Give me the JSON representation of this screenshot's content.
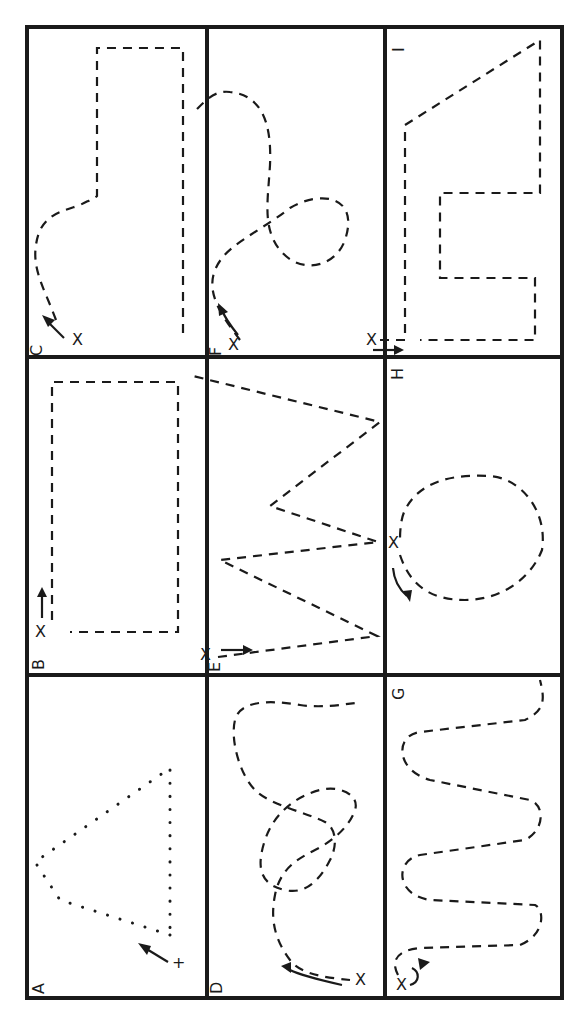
{
  "diagram": {
    "cells": [
      {
        "id": "A",
        "label": "A",
        "shape": "dotted triangle",
        "start_marker": "+",
        "direction": "arrow toward triangle"
      },
      {
        "id": "B",
        "label": "B",
        "shape": "dashed rectangle",
        "start_marker": "X",
        "direction": "arrow along long side"
      },
      {
        "id": "C",
        "label": "C",
        "shape": "dashed curve into tall rectangle",
        "start_marker": "X",
        "direction": "arrow along curve"
      },
      {
        "id": "D",
        "label": "D",
        "shape": "dashed curve with loop",
        "start_marker": "X",
        "direction": "curved arrow"
      },
      {
        "id": "E",
        "label": "E",
        "shape": "dashed zigzag",
        "start_marker": "X",
        "direction": "double arrow"
      },
      {
        "id": "F",
        "label": "F",
        "shape": "dashed figure with loop",
        "start_marker": "X",
        "direction": "curved arrow"
      },
      {
        "id": "G",
        "label": "G",
        "shape": "dashed serpentine",
        "start_marker": "X",
        "direction": "hook arrow"
      },
      {
        "id": "H",
        "label": "H",
        "shape": "dashed oval",
        "start_marker": "X",
        "direction": "curved arrow"
      },
      {
        "id": "I",
        "label": "I",
        "shape": "dashed polygon with notch",
        "start_marker": "X",
        "direction": "straight arrow"
      }
    ],
    "markers": {
      "start_x": "X",
      "start_plus": "+"
    }
  }
}
